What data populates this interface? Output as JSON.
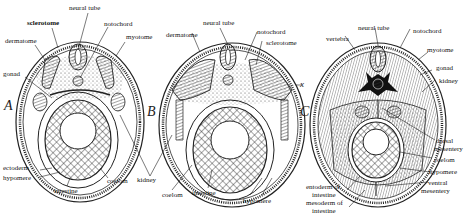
{
  "figure": {
    "panels": [
      {
        "id": "A",
        "letter": "A",
        "labels": {
          "neural_tube": "neural tube",
          "sclerotome": "sclerotome",
          "notochord": "notochord",
          "dermatome": "dermatome",
          "myotome": "myotome",
          "gonad": "gonad",
          "ectoderm": "ectoderm",
          "hypomere": "hypomere",
          "intestine": "intestine",
          "coelom": "coelom"
        }
      },
      {
        "id": "B",
        "letter": "B",
        "labels": {
          "neural_tube": "neural tube",
          "dermatome": "dermatome",
          "notochord": "notochord",
          "sclerotome": "sclerotome",
          "x_marker": "x",
          "kidney": "kidney",
          "coelom": "coelom",
          "intestine": "intestine",
          "hypomere": "hypomere"
        }
      },
      {
        "id": "C",
        "letter": "C",
        "labels": {
          "vertebra": "vertebra",
          "neural_tube": "neural tube",
          "notochord": "notochord",
          "myotome": "myotome",
          "gonad": "gonad",
          "kidney": "kidney",
          "dorsal_mesentery_1": "dorsal",
          "dorsal_mesentery_2": "mesentery",
          "coelom": "coelom",
          "hypomere": "hypomere",
          "ventral_mesentery_1": "ventral",
          "ventral_mesentery_2": "mesentery",
          "entoderm_1": "entoderm of",
          "entoderm_2": "intestine",
          "mesoderm_1": "mesoderm of",
          "mesoderm_2": "intestine"
        }
      }
    ]
  }
}
